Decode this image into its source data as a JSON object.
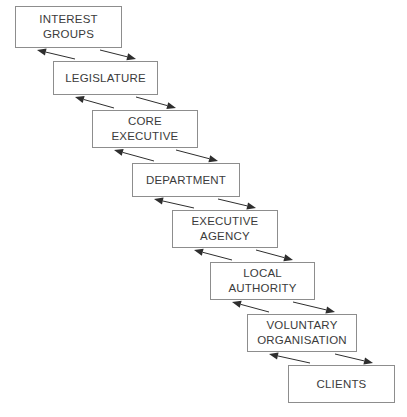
{
  "diagram": {
    "type": "flow-chain",
    "background_color": "#ffffff",
    "box_border_color": "#8d8d8d",
    "text_color": "#3b3b3b",
    "arrow_color": "#2e2e2e",
    "nodes": [
      {
        "id": "interest-groups",
        "label": "INTEREST\nGROUPS",
        "x": 15,
        "y": 6,
        "w": 107,
        "h": 42
      },
      {
        "id": "legislature",
        "label": "LEGISLATURE",
        "x": 53,
        "y": 61,
        "w": 105,
        "h": 34
      },
      {
        "id": "core-executive",
        "label": "CORE\nEXECUTIVE",
        "x": 92,
        "y": 110,
        "w": 106,
        "h": 38
      },
      {
        "id": "department",
        "label": "DEPARTMENT",
        "x": 132,
        "y": 163,
        "w": 108,
        "h": 34
      },
      {
        "id": "executive-agency",
        "label": "EXECUTIVE\nAGENCY",
        "x": 172,
        "y": 210,
        "w": 106,
        "h": 38
      },
      {
        "id": "local-authority",
        "label": "LOCAL\nAUTHORITY",
        "x": 210,
        "y": 262,
        "w": 105,
        "h": 38
      },
      {
        "id": "voluntary-organisation",
        "label": "VOLUNTARY\nORGANISATION",
        "x": 247,
        "y": 314,
        "w": 110,
        "h": 38
      },
      {
        "id": "clients",
        "label": "CLIENTS",
        "x": 288,
        "y": 365,
        "w": 107,
        "h": 38
      }
    ],
    "links": [
      {
        "from": "interest-groups",
        "to": "legislature",
        "direction": "bidirectional"
      },
      {
        "from": "legislature",
        "to": "core-executive",
        "direction": "bidirectional"
      },
      {
        "from": "core-executive",
        "to": "department",
        "direction": "bidirectional"
      },
      {
        "from": "department",
        "to": "executive-agency",
        "direction": "bidirectional"
      },
      {
        "from": "executive-agency",
        "to": "local-authority",
        "direction": "bidirectional"
      },
      {
        "from": "local-authority",
        "to": "voluntary-organisation",
        "direction": "bidirectional"
      },
      {
        "from": "voluntary-organisation",
        "to": "clients",
        "direction": "bidirectional"
      }
    ]
  }
}
